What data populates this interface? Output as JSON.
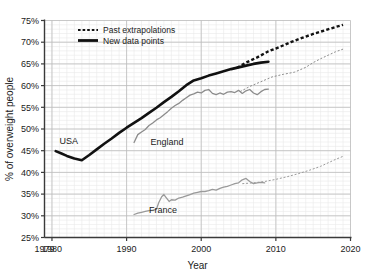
{
  "chart_data": {
    "type": "line",
    "title": "",
    "xlabel": "Year",
    "ylabel": "% of overweight people",
    "xlim": [
      1979,
      2020
    ],
    "ylim": [
      25,
      75
    ],
    "grid": true,
    "grid_minor": true,
    "legend_position": "top-left",
    "x_ticks": [
      "1979",
      "1980",
      "1990",
      "2000",
      "2010",
      "2020"
    ],
    "x_tick_values": [
      1979,
      1980,
      1990,
      2000,
      2010,
      2020
    ],
    "y_ticks": [
      "25%",
      "30%",
      "35%",
      "40%",
      "45%",
      "50%",
      "55%",
      "60%",
      "65%",
      "70%",
      "75%"
    ],
    "y_tick_values": [
      25,
      30,
      35,
      40,
      45,
      50,
      55,
      60,
      65,
      70,
      75
    ],
    "legend": [
      {
        "label": "Past extrapolations",
        "style": "dashed"
      },
      {
        "label": "New data points",
        "style": "solid"
      }
    ],
    "series": [
      {
        "name": "USA",
        "color": "#111111",
        "label_x": 1981.0,
        "label_y": 46.6,
        "solid": {
          "x": [
            1980.5,
            1981.2,
            1982.0,
            1983.0,
            1984.0,
            1985.0,
            1986.0,
            1987.0,
            1988.0,
            1989.0,
            1990.0,
            1991.0,
            1992.0,
            1993.0,
            1994.0,
            1995.0,
            1996.0,
            1997.0,
            1998.0,
            1999.0,
            2000.0,
            2001.0,
            2002.0,
            2003.0,
            2004.0,
            2005.0,
            2006.0,
            2007.0,
            2008.0,
            2009.0
          ],
          "y": [
            44.9,
            44.4,
            43.8,
            43.2,
            42.8,
            44.0,
            45.3,
            46.6,
            47.8,
            49.1,
            50.3,
            51.4,
            52.5,
            53.7,
            54.9,
            56.2,
            57.4,
            58.7,
            60.1,
            61.2,
            61.7,
            62.3,
            62.8,
            63.3,
            63.8,
            64.2,
            64.6,
            65.0,
            65.3,
            65.5
          ]
        },
        "dashed": {
          "x": [
            2004.8,
            2006.0,
            2007.5,
            2009.0,
            2010.5,
            2012.0,
            2013.5,
            2015.0,
            2016.5,
            2018.0,
            2019.0
          ],
          "y": [
            64.1,
            65.3,
            66.5,
            67.9,
            68.9,
            70.0,
            71.0,
            71.9,
            72.7,
            73.5,
            74.0
          ]
        }
      },
      {
        "name": "England",
        "color": "#8c8c8c",
        "label_x": 1993.2,
        "label_y": 46.3,
        "solid": {
          "x": [
            1991.0,
            1991.5,
            1992.0,
            1992.5,
            1993.0,
            1993.5,
            1994.0,
            1994.5,
            1995.0,
            1995.5,
            1996.0,
            1996.5,
            1997.0,
            1997.5,
            1998.0,
            1998.5,
            1999.0,
            1999.5,
            2000.0,
            2000.5,
            2001.0,
            2001.5,
            2002.0,
            2002.5,
            2003.0,
            2003.5,
            2004.0,
            2004.5,
            2005.0,
            2005.5,
            2006.0,
            2006.5,
            2007.0,
            2007.5,
            2008.0,
            2008.5,
            2009.0
          ],
          "y": [
            46.9,
            48.7,
            49.3,
            49.9,
            50.8,
            51.4,
            52.1,
            52.6,
            53.3,
            54.0,
            54.8,
            55.4,
            55.9,
            56.6,
            57.2,
            57.8,
            58.1,
            58.5,
            58.3,
            58.9,
            59.1,
            58.2,
            57.9,
            58.3,
            58.0,
            58.5,
            58.6,
            58.4,
            58.9,
            58.2,
            58.8,
            59.1,
            58.3,
            57.9,
            58.6,
            59.1,
            59.2
          ]
        },
        "dashed": {
          "x": [
            2005.2,
            2006.5,
            2008.0,
            2009.5,
            2011.0,
            2012.5,
            2014.0,
            2015.0,
            2016.0,
            2017.0,
            2018.0,
            2019.0
          ],
          "y": [
            58.6,
            59.8,
            60.9,
            62.0,
            62.6,
            63.1,
            64.2,
            65.3,
            66.2,
            67.0,
            67.8,
            68.4
          ]
        }
      },
      {
        "name": "France",
        "color": "#9a9a9a",
        "label_x": 1993.0,
        "label_y": 30.6,
        "solid": {
          "x": [
            1991.0,
            1991.5,
            1992.0,
            1992.5,
            1993.0,
            1993.5,
            1994.0,
            1994.3,
            1994.7,
            1995.0,
            1995.3,
            1995.7,
            1996.0,
            1996.5,
            1997.0,
            1997.5,
            1998.0,
            1998.5,
            1999.0,
            1999.5,
            2000.0,
            2000.5,
            2001.0,
            2001.5,
            2002.0,
            2002.5,
            2003.0,
            2003.5,
            2004.0,
            2004.5,
            2005.0,
            2005.5,
            2006.0,
            2006.5,
            2007.0,
            2007.5,
            2008.0,
            2008.5
          ],
          "y": [
            30.3,
            30.6,
            30.8,
            31.0,
            31.2,
            31.3,
            31.5,
            33.0,
            34.4,
            34.9,
            34.2,
            33.3,
            33.7,
            33.6,
            34.1,
            34.3,
            34.6,
            34.9,
            35.2,
            35.4,
            35.6,
            35.6,
            35.8,
            36.1,
            35.9,
            36.3,
            36.6,
            36.8,
            37.1,
            37.4,
            37.6,
            38.3,
            38.6,
            37.9,
            37.4,
            37.6,
            37.7,
            37.6
          ]
        },
        "dashed": {
          "x": [
            2005.5,
            2007.0,
            2008.5,
            2010.0,
            2011.5,
            2013.0,
            2014.5,
            2016.0,
            2017.0,
            2018.0,
            2019.0
          ],
          "y": [
            37.4,
            37.6,
            37.9,
            38.4,
            39.0,
            39.7,
            40.5,
            41.4,
            42.2,
            43.0,
            43.7
          ]
        }
      }
    ]
  }
}
